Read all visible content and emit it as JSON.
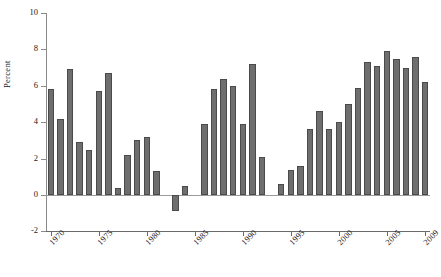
{
  "chart_data": {
    "type": "bar",
    "title": "",
    "subtitle": "",
    "xlabel": "",
    "ylabel": "Percent",
    "categories": [
      "1970",
      "1971",
      "1972",
      "1973",
      "1974",
      "1975",
      "1976",
      "1977",
      "1978",
      "1979",
      "1980",
      "1981",
      "1982",
      "1983",
      "1984",
      "1985",
      "1986",
      "1987",
      "1988",
      "1989",
      "1990",
      "1991",
      "1992",
      "1993",
      "1994",
      "1995",
      "1996",
      "1997",
      "1998",
      "1999",
      "2000",
      "2001",
      "2002",
      "2003",
      "2004",
      "2005",
      "2006",
      "2007",
      "2008",
      "2009"
    ],
    "values": [
      5.8,
      4.2,
      6.9,
      2.9,
      2.5,
      5.7,
      6.7,
      0.4,
      2.2,
      3.0,
      3.2,
      1.3,
      0.0,
      -0.9,
      0.5,
      0.0,
      3.9,
      5.8,
      6.4,
      6.0,
      3.9,
      7.2,
      2.1,
      0.0,
      0.6,
      1.4,
      1.6,
      3.6,
      4.6,
      3.6,
      4.0,
      5.0,
      5.9,
      7.3,
      7.1,
      7.9,
      7.5,
      7.0,
      7.6,
      6.2
    ],
    "ylim": [
      -2,
      10
    ],
    "yticks": [
      -2,
      0,
      2,
      4,
      6,
      8,
      10
    ],
    "ytick_labels": [
      "-2",
      "0",
      "2",
      "4",
      "6",
      "8",
      "10"
    ],
    "xticks": [
      1970,
      1975,
      1980,
      1985,
      1990,
      1995,
      2000,
      2005,
      2009
    ],
    "xtick_labels": [
      "1970",
      "1975",
      "1980",
      "1985",
      "1990",
      "1995",
      "2000",
      "2005",
      "2009"
    ],
    "grid": false,
    "legend": null,
    "bar_color": "#6e6e6e",
    "bar_edge_color": "#4a4a4a",
    "axis_color": "#6a6a6a",
    "text_color": "#1a1a1a"
  }
}
